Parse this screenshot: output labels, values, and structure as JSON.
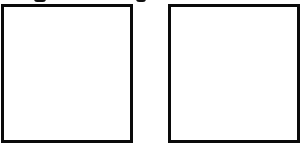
{
  "panels": [
    {
      "id": "left",
      "label": "",
      "content": ""
    },
    {
      "id": "right",
      "label": "",
      "content": ""
    }
  ],
  "cropped_text_above": {
    "note_visible": "descender fragments only, unreadable",
    "fragments": [
      {
        "x": 34,
        "width": 12
      },
      {
        "x": 136,
        "width": 10
      }
    ]
  },
  "colors": {
    "border": "#0a0a0a",
    "background": "#ffffff"
  }
}
